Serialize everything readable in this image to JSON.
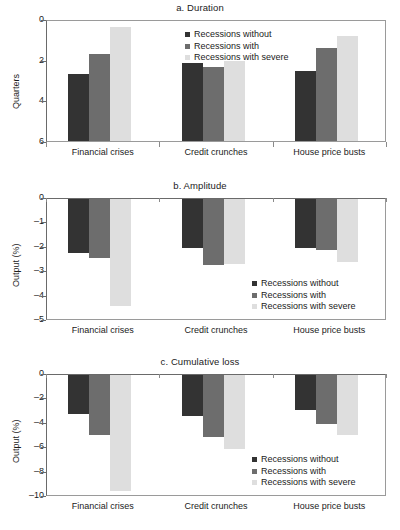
{
  "figure": {
    "series_names": [
      "Recessions without",
      "Recessions with",
      "Recessions with severe"
    ],
    "series_colors": [
      "#333333",
      "#6d6d6d",
      "#dedede"
    ],
    "categories": [
      "Financial crises",
      "Credit crunches",
      "House price busts"
    ]
  },
  "panels": {
    "a": {
      "title": "a. Duration",
      "ylabel": "Quarters",
      "yticks": [
        "6",
        "4",
        "2",
        "0"
      ]
    },
    "b": {
      "title": "b. Amplitude",
      "ylabel": "Output (%)",
      "yticks": [
        "0",
        "–1",
        "–2",
        "–3",
        "–4",
        "–5"
      ]
    },
    "c": {
      "title": "c. Cumulative loss",
      "ylabel": "Output (%)",
      "yticks": [
        "0",
        "–2",
        "–4",
        "–6",
        "–8",
        "–10"
      ]
    }
  },
  "chart_data": [
    {
      "type": "bar",
      "id": "a",
      "title": "a. Duration",
      "xlabel": "",
      "ylabel": "Quarters",
      "categories": [
        "Financial crises",
        "Credit crunches",
        "House price busts"
      ],
      "series": [
        {
          "name": "Recessions without",
          "values": [
            3.4,
            3.95,
            3.55
          ]
        },
        {
          "name": "Recessions with",
          "values": [
            4.4,
            3.75,
            4.65
          ]
        },
        {
          "name": "Recessions with severe",
          "values": [
            5.7,
            4.05,
            5.25
          ]
        }
      ],
      "ylim": [
        0,
        6
      ],
      "ytick_values": [
        0,
        2,
        4,
        6
      ],
      "grid": false,
      "legend_position": "top-right"
    },
    {
      "type": "bar",
      "id": "b",
      "title": "b. Amplitude",
      "xlabel": "",
      "ylabel": "Output (%)",
      "categories": [
        "Financial crises",
        "Credit crunches",
        "House price busts"
      ],
      "series": [
        {
          "name": "Recessions without",
          "values": [
            -2.2,
            -2.0,
            -2.0
          ]
        },
        {
          "name": "Recessions with",
          "values": [
            -2.4,
            -2.7,
            -2.1
          ]
        },
        {
          "name": "Recessions with severe",
          "values": [
            -4.4,
            -2.65,
            -2.6
          ]
        }
      ],
      "ylim": [
        -5,
        0
      ],
      "ytick_values": [
        0,
        -1,
        -2,
        -3,
        -4,
        -5
      ],
      "grid": false,
      "legend_position": "bottom-right"
    },
    {
      "type": "bar",
      "id": "c",
      "title": "c. Cumulative loss",
      "xlabel": "",
      "ylabel": "Output (%)",
      "categories": [
        "Financial crises",
        "Credit crunches",
        "House price busts"
      ],
      "series": [
        {
          "name": "Recessions without",
          "values": [
            -3.2,
            -3.4,
            -2.9
          ]
        },
        {
          "name": "Recessions with",
          "values": [
            -4.9,
            -5.1,
            -4.0
          ]
        },
        {
          "name": "Recessions with severe",
          "values": [
            -9.5,
            -6.1,
            -4.9
          ]
        }
      ],
      "ylim": [
        -10,
        0
      ],
      "ytick_values": [
        0,
        -2,
        -4,
        -6,
        -8,
        -10
      ],
      "grid": false,
      "legend_position": "bottom-right"
    }
  ]
}
